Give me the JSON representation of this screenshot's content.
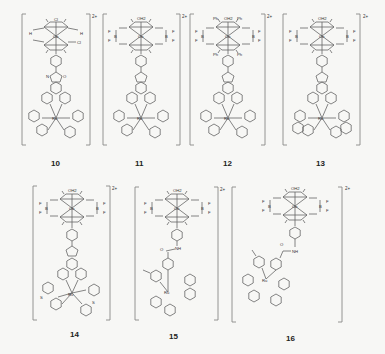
{
  "figure": {
    "charge": "2+",
    "metals": {
      "top": "Co",
      "bottom": "Ru"
    },
    "atoms": {
      "N": "N",
      "O": "O",
      "H": "H",
      "B": "B",
      "F": "F",
      "S": "S",
      "Cl": "Cl",
      "OH2": "OH2",
      "Ph": "Ph",
      "NH": "NH"
    },
    "compounds": [
      {
        "id": "10",
        "label": "10",
        "axial_ligand": "Cl",
        "bridge": "BH (H)",
        "linker": "imidazo-phenanthroline",
        "ru_ligands": "bpy"
      },
      {
        "id": "11",
        "label": "11",
        "axial_ligand": "OH2",
        "bridge": "BF2",
        "linker": "imidazo-phenanthroline",
        "ru_ligands": "bpy"
      },
      {
        "id": "12",
        "label": "12",
        "axial_ligand": "OH2",
        "bridge": "BF2",
        "substituent": "Ph",
        "linker": "imidazo-phenanthroline",
        "ru_ligands": "bpy"
      },
      {
        "id": "13",
        "label": "13",
        "axial_ligand": "OH2",
        "bridge": "BF2",
        "linker": "imidazo-phenanthroline",
        "ru_ligands": "phen"
      },
      {
        "id": "14",
        "label": "14",
        "axial_ligand": "OH2",
        "bridge": "BF2",
        "linker": "imidazo-phenanthroline",
        "ru_ligands": "pyridyl-benzothiazole"
      },
      {
        "id": "15",
        "label": "15",
        "axial_ligand": "OH2",
        "bridge": "BF2",
        "linker": "amide-bpy",
        "ru_ligands": "bpy"
      },
      {
        "id": "16",
        "label": "16",
        "axial_ligand": "OH2",
        "bridge": "BF2",
        "linker": "methylene-amide-bpy",
        "ru_ligands": "bpy"
      }
    ]
  }
}
